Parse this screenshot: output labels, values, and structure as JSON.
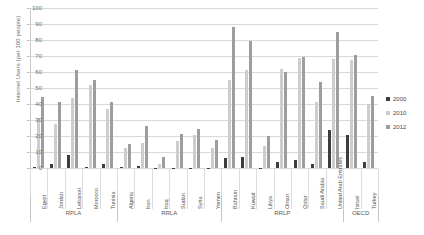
{
  "chart_data": {
    "type": "bar",
    "title": "",
    "xlabel": "",
    "ylabel": "Internet Users (per 100 people)",
    "ylim": [
      0,
      100
    ],
    "yticks": [
      0,
      10,
      20,
      30,
      40,
      50,
      60,
      70,
      80,
      90,
      100
    ],
    "grid": true,
    "legend_position": "right",
    "categories": [
      "Egypt",
      "Jordan",
      "Lebanon",
      "Morocco",
      "Tunisia",
      "Algeria",
      "Iran",
      "Iraq",
      "Sudan",
      "Syria",
      "Yemen",
      "Bahrain",
      "Kuwait",
      "Libya",
      "Oman",
      "Qatar",
      "Saudi Arabia",
      "United Arab Emirates",
      "Israel",
      "Turkey"
    ],
    "groups": [
      {
        "label": "RPLA",
        "categories": [
          "Egypt",
          "Jordan",
          "Lebanon",
          "Morocco",
          "Tunisia"
        ]
      },
      {
        "label": "RRLA",
        "categories": [
          "Algeria",
          "Iran",
          "Iraq",
          "Sudan",
          "Syria",
          "Yemen"
        ]
      },
      {
        "label": "RRLP",
        "categories": [
          "Bahrain",
          "Kuwait",
          "Libya",
          "Oman",
          "Qatar",
          "Saudi Arabia",
          "United Arab Emirates"
        ]
      },
      {
        "label": "OECD",
        "categories": [
          "Israel",
          "Turkey"
        ]
      }
    ],
    "series": [
      {
        "name": "2000",
        "color": "#3d3d3d",
        "values": [
          0.6,
          2.5,
          8.0,
          0.7,
          2.8,
          0.5,
          1.0,
          0.0,
          0.0,
          0.2,
          0.1,
          6.0,
          6.7,
          0.2,
          3.5,
          4.9,
          2.2,
          23.6,
          20.9,
          3.8
        ]
      },
      {
        "name": "2010",
        "color": "#cdcdcd",
        "values": [
          31.4,
          27.2,
          43.7,
          52.0,
          36.8,
          12.5,
          15.9,
          2.5,
          16.7,
          20.7,
          12.3,
          55.0,
          61.4,
          14.0,
          62.0,
          69.0,
          41.0,
          68.0,
          67.5,
          39.8
        ]
      },
      {
        "name": "2012",
        "color": "#9d9d9d",
        "values": [
          44.1,
          41.0,
          61.2,
          55.0,
          41.4,
          15.2,
          26.0,
          7.1,
          21.0,
          24.3,
          17.4,
          88.0,
          79.2,
          19.9,
          60.0,
          69.3,
          54.0,
          85.0,
          70.8,
          45.1
        ]
      }
    ]
  },
  "legend": {
    "items": [
      {
        "label": "2000"
      },
      {
        "label": "2010"
      },
      {
        "label": "2012"
      }
    ]
  }
}
